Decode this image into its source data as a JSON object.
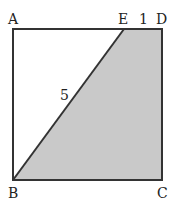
{
  "diagram": {
    "type": "geometry-square",
    "colors": {
      "stroke": "#333333",
      "shade": "#c9c9c9",
      "background": "#ffffff"
    },
    "vertices": {
      "A": {
        "label": "A",
        "x": 13,
        "y": 29
      },
      "D": {
        "label": "D",
        "x": 162,
        "y": 29
      },
      "B": {
        "label": "B",
        "x": 13,
        "y": 180
      },
      "C": {
        "label": "C",
        "x": 162,
        "y": 180
      },
      "E": {
        "label": "E",
        "x": 124,
        "y": 29
      }
    },
    "segment_labels": {
      "BE": "5",
      "ED": "1"
    },
    "shaded_region": "EDCB"
  }
}
